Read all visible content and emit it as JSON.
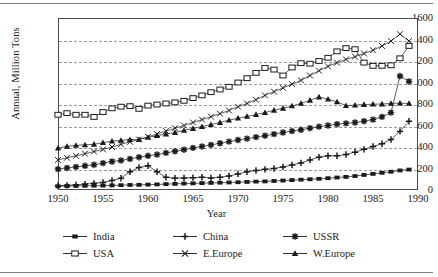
{
  "chart_data": {
    "type": "line",
    "title": "",
    "xlabel": "Year",
    "ylabel": "Annual, Million Tons",
    "xlim": [
      1950,
      1990
    ],
    "ylim": [
      0,
      1600
    ],
    "xticks": [
      1950,
      1955,
      1960,
      1965,
      1970,
      1975,
      1980,
      1985,
      1990
    ],
    "yticks": [
      0,
      200,
      400,
      600,
      800,
      1000,
      1200,
      1400,
      1600
    ],
    "grid": "horizontal-dashed",
    "legend_position": "below-axes",
    "x": [
      1950,
      1951,
      1952,
      1953,
      1954,
      1955,
      1956,
      1957,
      1958,
      1959,
      1960,
      1961,
      1962,
      1963,
      1964,
      1965,
      1966,
      1967,
      1968,
      1969,
      1970,
      1971,
      1972,
      1973,
      1974,
      1975,
      1976,
      1977,
      1978,
      1979,
      1980,
      1981,
      1982,
      1983,
      1984,
      1985,
      1986,
      1987,
      1988,
      1989
    ],
    "series": [
      {
        "name": "India",
        "marker": "filled-square",
        "values": [
          35,
          37,
          38,
          39,
          40,
          41,
          43,
          45,
          47,
          48,
          50,
          52,
          55,
          57,
          60,
          62,
          64,
          66,
          68,
          70,
          72,
          75,
          78,
          80,
          84,
          88,
          92,
          96,
          100,
          104,
          110,
          116,
          122,
          130,
          140,
          150,
          160,
          170,
          182,
          190
        ]
      },
      {
        "name": "China",
        "marker": "plus",
        "values": [
          40,
          43,
          48,
          55,
          62,
          70,
          88,
          110,
          170,
          210,
          225,
          170,
          118,
          110,
          112,
          115,
          118,
          112,
          118,
          130,
          150,
          170,
          182,
          192,
          200,
          215,
          232,
          252,
          280,
          305,
          318,
          318,
          330,
          352,
          378,
          405,
          430,
          470,
          545,
          640
        ]
      },
      {
        "name": "USSR",
        "marker": "star",
        "values": [
          195,
          205,
          215,
          225,
          235,
          250,
          265,
          275,
          290,
          305,
          318,
          330,
          345,
          360,
          375,
          392,
          405,
          420,
          435,
          450,
          465,
          478,
          492,
          505,
          520,
          535,
          548,
          560,
          575,
          590,
          600,
          612,
          620,
          628,
          640,
          655,
          680,
          720,
          1060,
          1010
        ]
      },
      {
        "name": "USA",
        "marker": "open-square",
        "values": [
          700,
          715,
          700,
          700,
          680,
          725,
          760,
          775,
          780,
          755,
          785,
          795,
          805,
          815,
          830,
          855,
          880,
          910,
          935,
          960,
          1000,
          1040,
          1090,
          1135,
          1120,
          1065,
          1140,
          1180,
          1175,
          1200,
          1230,
          1290,
          1320,
          1310,
          1185,
          1155,
          1155,
          1160,
          1225,
          1340
        ]
      },
      {
        "name": "E.Europe",
        "marker": "cross",
        "values": [
          280,
          300,
          318,
          338,
          358,
          378,
          400,
          425,
          448,
          470,
          495,
          520,
          548,
          575,
          600,
          628,
          655,
          682,
          710,
          740,
          775,
          805,
          840,
          880,
          915,
          950,
          985,
          1020,
          1065,
          1110,
          1150,
          1185,
          1215,
          1240,
          1270,
          1300,
          1340,
          1385,
          1450,
          1385
        ]
      },
      {
        "name": "W.Europe",
        "marker": "filled-triangle",
        "values": [
          390,
          405,
          415,
          420,
          425,
          440,
          455,
          462,
          468,
          470,
          490,
          505,
          520,
          535,
          555,
          572,
          590,
          608,
          628,
          650,
          668,
          685,
          702,
          720,
          742,
          760,
          782,
          805,
          835,
          865,
          845,
          820,
          785,
          790,
          795,
          798,
          800,
          805,
          808,
          805
        ]
      }
    ]
  },
  "legend": {
    "items": [
      {
        "label": "India",
        "marker": "filled-square"
      },
      {
        "label": "China",
        "marker": "plus"
      },
      {
        "label": "USSR",
        "marker": "star"
      },
      {
        "label": "USA",
        "marker": "open-square"
      },
      {
        "label": "E.Europe",
        "marker": "cross"
      },
      {
        "label": "W.Europe",
        "marker": "filled-triangle"
      }
    ]
  },
  "colors": {
    "ink": "#1b1b1b",
    "grid": "#9a9a9a",
    "frame": "#4a4a4a"
  }
}
